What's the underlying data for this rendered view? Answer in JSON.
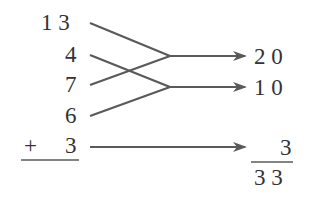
{
  "left_column": {
    "addends": [
      {
        "label": "1 3",
        "value": 13
      },
      {
        "label": "4",
        "value": 4
      },
      {
        "label": "7",
        "value": 7
      },
      {
        "label": "6",
        "value": 6
      }
    ],
    "plus_sign": "+",
    "last_addend": "3"
  },
  "groupings": [
    {
      "from": [
        "13",
        "7"
      ],
      "result": "2 0",
      "result_value": 20
    },
    {
      "from": [
        "4",
        "6"
      ],
      "result": "1 0",
      "result_value": 10
    },
    {
      "from": [
        "3"
      ],
      "result": "3",
      "result_value": 3
    }
  ],
  "sum": {
    "label": "3 3",
    "value": 33
  },
  "colors": {
    "line": "#5a5a5a",
    "text": "#333333"
  }
}
